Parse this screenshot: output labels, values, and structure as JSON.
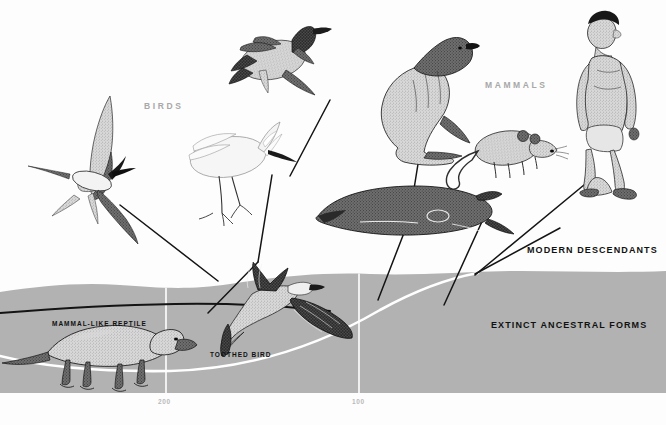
{
  "figure": {
    "title_groups": {
      "birds": "BIRDS",
      "mammals": "MAMMALS"
    },
    "captions": {
      "modern_descendants": "MODERN DESCENDANTS",
      "extinct_ancestral_forms": "EXTINCT ANCESTRAL FORMS",
      "mammal_like_reptile": "MAMMAL-LIKE REPTILE",
      "toothed_bird": "TOOTHED BIRD"
    },
    "timeline": {
      "ticks": [
        {
          "label": "200",
          "x": 166
        },
        {
          "label": "100",
          "x": 359
        }
      ]
    },
    "colors": {
      "background": "#fdfdfd",
      "ancestral_band": "#b2b2b2",
      "gridline": "#ffffff",
      "lineage_line": "#111111",
      "bird_lineage_line": "#ffffff",
      "group_label": "#a8a8a8",
      "caption": "#111111",
      "tick_label": "#b9b9b9"
    },
    "organisms": [
      {
        "name": "tern-in-flight",
        "group": "birds",
        "state": "modern"
      },
      {
        "name": "duck-landing",
        "group": "birds",
        "state": "modern"
      },
      {
        "name": "egret-wading",
        "group": "birds",
        "state": "modern"
      },
      {
        "name": "sea-lion",
        "group": "mammals",
        "state": "modern"
      },
      {
        "name": "sperm-whale",
        "group": "mammals",
        "state": "modern"
      },
      {
        "name": "rat",
        "group": "mammals",
        "state": "modern"
      },
      {
        "name": "walking-man",
        "group": "mammals",
        "state": "modern"
      },
      {
        "name": "archaeopteryx-toothed-bird",
        "group": "birds",
        "state": "extinct"
      },
      {
        "name": "mammal-like-reptile",
        "group": "mammals",
        "state": "extinct"
      }
    ]
  }
}
